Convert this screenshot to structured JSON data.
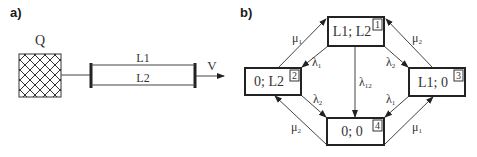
{
  "panel_a": {
    "label": "a)",
    "source_label": "Q",
    "line1_label": "L1",
    "line2_label": "L2",
    "output_label": "V"
  },
  "panel_b": {
    "label": "b)",
    "states": [
      {
        "id": "1",
        "text": "L1; L2"
      },
      {
        "id": "2",
        "text": "0; L2"
      },
      {
        "id": "3",
        "text": "L1; 0"
      },
      {
        "id": "4",
        "text": "0; 0"
      }
    ],
    "transitions": [
      {
        "from": "2",
        "to": "1",
        "symbol": "μ",
        "sub": "1"
      },
      {
        "from": "1",
        "to": "2",
        "symbol": "λ",
        "sub": "1"
      },
      {
        "from": "3",
        "to": "1",
        "symbol": "μ",
        "sub": "2"
      },
      {
        "from": "1",
        "to": "3",
        "symbol": "λ",
        "sub": "2"
      },
      {
        "from": "1",
        "to": "4",
        "symbol": "λ",
        "sub": "12"
      },
      {
        "from": "2",
        "to": "4",
        "symbol": "λ",
        "sub": "2"
      },
      {
        "from": "4",
        "to": "2",
        "symbol": "μ",
        "sub": "2"
      },
      {
        "from": "3",
        "to": "4",
        "symbol": "λ",
        "sub": "1"
      },
      {
        "from": "4",
        "to": "3",
        "symbol": "μ",
        "sub": "1"
      }
    ]
  }
}
